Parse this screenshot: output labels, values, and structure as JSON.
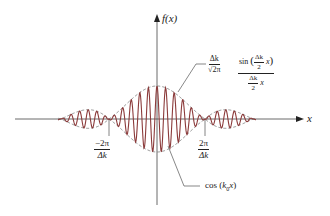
{
  "figure": {
    "colors": {
      "carrier": "#8b3a3a",
      "envelope": "#777777",
      "axes": "#444444",
      "text": "#222222"
    },
    "axes": {
      "y_label": "f(x)",
      "x_label": "x"
    },
    "ticks": {
      "left": {
        "sign": "−",
        "num": "2π",
        "den": "Δk"
      },
      "right": {
        "num": "2π",
        "den": "Δk"
      }
    },
    "annotations": {
      "amplitude": {
        "num": "Δk",
        "den": "√2π"
      },
      "envelope": {
        "func": "sin",
        "inner_num": "Δk",
        "inner_den": "2",
        "inner_var": "x",
        "den_num": "Δk",
        "den_den": "2",
        "den_var": "x"
      },
      "carrier": {
        "text": "cos",
        "arg_k": "k",
        "arg_sub": "0",
        "arg_var": "x"
      }
    }
  },
  "chart_data": {
    "type": "line",
    "title": "",
    "xlabel": "x",
    "ylabel": "f(x)",
    "series": [
      {
        "name": "f(x) = (Δk/√2π) · sin(Δk x/2)/(Δk x/2) · cos(k0 x)",
        "style": "solid"
      },
      {
        "name": "envelope ±(Δk/√2π) · sin(Δk x/2)/(Δk x/2)",
        "style": "dashed"
      }
    ],
    "x_ticks": [
      "-2π/Δk",
      "2π/Δk"
    ],
    "envelope_zeros": [
      "-2π/Δk",
      "2π/Δk"
    ],
    "peak_value": "Δk/√2π",
    "grid": false
  }
}
